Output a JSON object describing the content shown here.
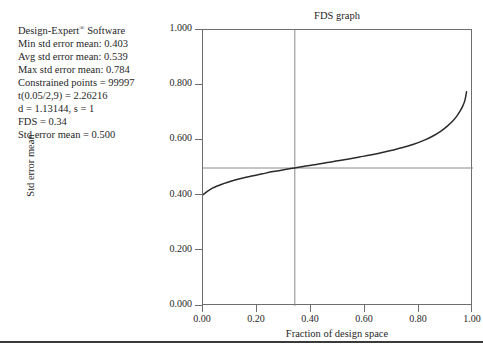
{
  "software": {
    "name": "Design-Expert® Software",
    "lines": [
      "Design-Expert® Software",
      "Min std error mean: 0.403",
      "Avg std error mean: 0.539",
      "Max std error mean: 0.784",
      "Constrained points = 99997",
      "t(0.05/2,9) = 2.26216",
      "d = 1.13144, s = 1",
      "FDS = 0.34",
      "Std error mean = 0.500"
    ],
    "min_std_error_mean": 0.403,
    "avg_std_error_mean": 0.539,
    "max_std_error_mean": 0.784,
    "constrained_points": 99997,
    "t_value": 2.26216,
    "d": 1.13144,
    "s": 1,
    "fds": 0.34,
    "std_error_mean_target": 0.5
  },
  "chart_data": {
    "type": "line",
    "title": "FDS graph",
    "xlabel": "Fraction of design space",
    "ylabel": "Std error mean",
    "xlim": [
      0.0,
      1.0
    ],
    "ylim": [
      0.0,
      1.0
    ],
    "xticks": [
      0.0,
      0.2,
      0.4,
      0.6,
      0.8,
      1.0
    ],
    "xtick_labels": [
      "0.00",
      "0.20",
      "0.40",
      "0.60",
      "0.80",
      "1.00"
    ],
    "yticks": [
      0.0,
      0.2,
      0.4,
      0.6,
      0.8,
      1.0
    ],
    "ytick_labels": [
      "0.000",
      "0.200",
      "0.400",
      "0.600",
      "0.800",
      "1.000"
    ],
    "grid": false,
    "legend": "none",
    "series": [
      {
        "name": "Std error mean",
        "color": "#2b2b2b",
        "x": [
          0.0,
          0.01,
          0.02,
          0.035,
          0.05,
          0.075,
          0.1,
          0.14,
          0.18,
          0.22,
          0.26,
          0.3,
          0.34,
          0.38,
          0.42,
          0.46,
          0.5,
          0.54,
          0.58,
          0.62,
          0.66,
          0.7,
          0.74,
          0.78,
          0.82,
          0.85,
          0.88,
          0.905,
          0.925,
          0.94,
          0.952,
          0.962,
          0.97,
          0.976
        ],
        "y": [
          0.403,
          0.411,
          0.418,
          0.427,
          0.434,
          0.443,
          0.451,
          0.462,
          0.471,
          0.479,
          0.487,
          0.494,
          0.5,
          0.507,
          0.513,
          0.52,
          0.526,
          0.533,
          0.54,
          0.547,
          0.555,
          0.564,
          0.574,
          0.586,
          0.601,
          0.615,
          0.633,
          0.652,
          0.67,
          0.688,
          0.706,
          0.724,
          0.745,
          0.776
        ]
      }
    ],
    "reference_lines": [
      {
        "name": "std-error-mean-reference",
        "orientation": "horizontal",
        "value": 0.5,
        "color": "#8a8a8a"
      },
      {
        "name": "fds-reference",
        "orientation": "vertical",
        "value": 0.34,
        "color": "#8a8a8a"
      }
    ]
  }
}
